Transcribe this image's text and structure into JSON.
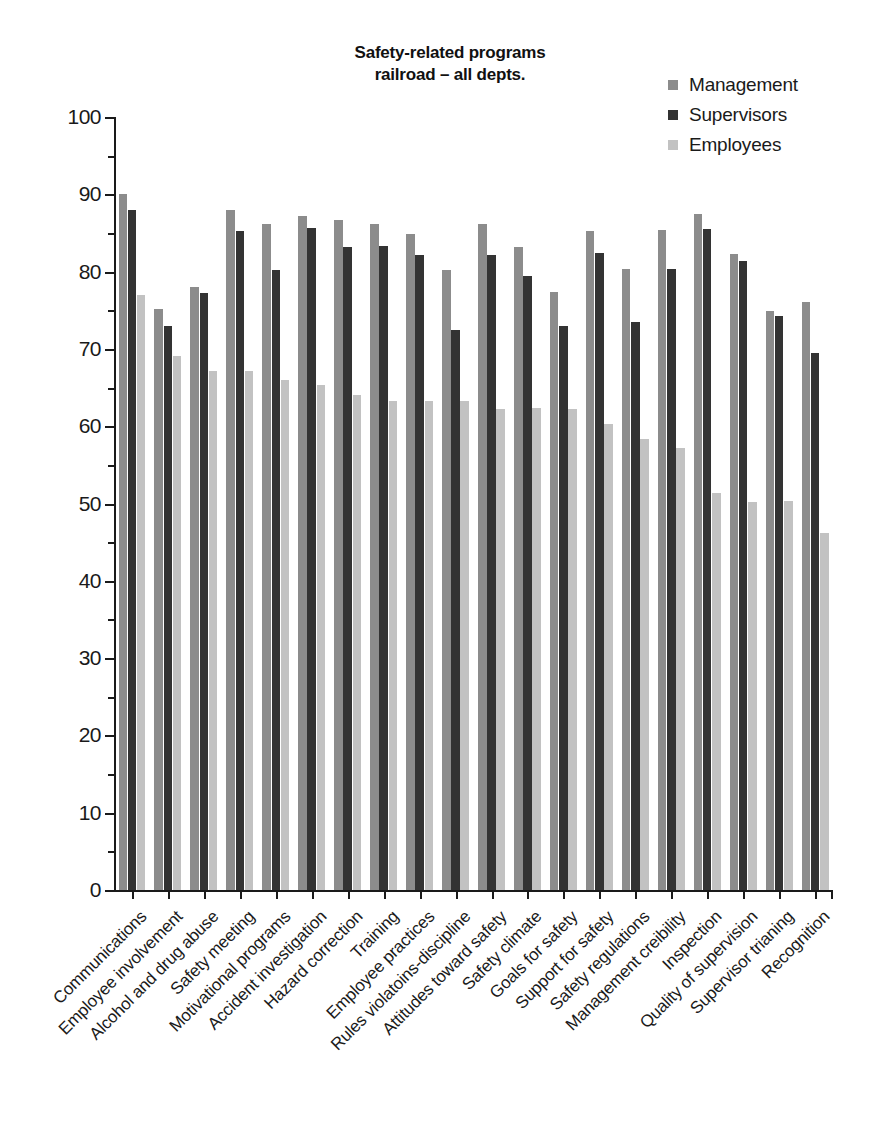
{
  "chart_data": {
    "type": "bar",
    "title": "Safety-related programs railroad – all depts.",
    "title_line1": "Safety-related programs",
    "title_line2": "railroad – all depts.",
    "xlabel": "",
    "ylabel": "",
    "ylim": [
      0,
      100
    ],
    "ytick_step": 10,
    "yminor_step": 5,
    "grid": false,
    "legend_position": "top-right",
    "categories": [
      "Communications",
      "Employee involvement",
      "Alcohol and drug abuse",
      "Safety meeting",
      "Motivational programs",
      "Accident investigation",
      "Hazard correction",
      "Training",
      "Employee practices",
      "Rules violatoins-discipline",
      "Attitudes toward safety",
      "Safety climate",
      "Goals for safety",
      "Support for safety",
      "Safety regulations",
      "Management creibility",
      "Inspection",
      "Quality of supervision",
      "Supervisor trianing",
      "Recognition"
    ],
    "ytick_labels": [
      "0",
      "10",
      "20",
      "30",
      "40",
      "50",
      "60",
      "70",
      "80",
      "90",
      "100"
    ],
    "series": [
      {
        "name": "Management",
        "color": "#8c8c8c",
        "values": [
          90.0,
          75.2,
          78.0,
          88.0,
          86.2,
          87.2,
          86.7,
          86.2,
          84.9,
          80.2,
          86.2,
          83.2,
          77.3,
          85.3,
          80.4,
          85.4,
          87.4,
          82.3,
          74.9,
          76.1
        ]
      },
      {
        "name": "Supervisors",
        "color": "#333333",
        "values": [
          88.0,
          73.0,
          77.2,
          85.2,
          80.2,
          85.7,
          83.2,
          83.3,
          82.2,
          72.4,
          82.2,
          79.4,
          72.9,
          82.4,
          73.5,
          80.4,
          85.5,
          81.4,
          74.2,
          69.5
        ]
      },
      {
        "name": "Employees",
        "color": "#c2c2c2",
        "values": [
          77.0,
          69.1,
          67.2,
          67.2,
          66.0,
          65.3,
          64.1,
          63.2,
          63.2,
          63.2,
          62.2,
          62.3,
          62.2,
          60.3,
          58.3,
          57.2,
          51.4,
          50.2,
          50.3,
          46.2
        ]
      }
    ]
  },
  "legend": {
    "items": [
      {
        "label": "Management",
        "color": "#8c8c8c"
      },
      {
        "label": "Supervisors",
        "color": "#333333"
      },
      {
        "label": "Employees",
        "color": "#c2c2c2"
      }
    ]
  }
}
